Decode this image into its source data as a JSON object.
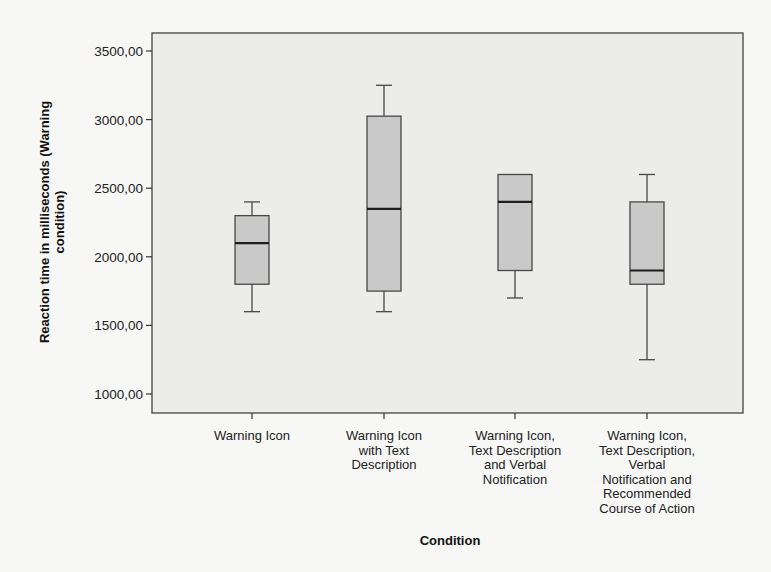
{
  "chart_data": {
    "type": "boxplot",
    "title": "",
    "xlabel": "Condition",
    "ylabel": "Reaction time in milliseconds (Warning condition)",
    "ylabel_lines": [
      "Reaction time in milliseconds (Warning",
      "condition)"
    ],
    "ylim": [
      850,
      3600
    ],
    "yticks": [
      1000,
      1500,
      2000,
      2500,
      3000,
      3500
    ],
    "ytick_labels": [
      "1000,00",
      "1500,00",
      "2000,00",
      "2500,00",
      "3000,00",
      "3500,00"
    ],
    "grid": false,
    "legend": null,
    "categories": [
      "Warning Icon",
      "Warning Icon with Text Description",
      "Warning Icon, Text Description and Verbal Notification",
      "Warning Icon, Text Description, Verbal Notification and Recommended Course of Action"
    ],
    "category_label_lines": [
      [
        "Warning Icon"
      ],
      [
        "Warning Icon",
        "with Text",
        "Description"
      ],
      [
        "Warning Icon,",
        "Text Description",
        "and Verbal",
        "Notification"
      ],
      [
        "Warning Icon,",
        "Text Description,",
        "Verbal",
        "Notification and",
        "Recommended",
        "Course of Action"
      ]
    ],
    "boxes": [
      {
        "category": "Warning Icon",
        "min": 1600,
        "q1": 1800,
        "median": 2100,
        "q3": 2300,
        "max": 2400
      },
      {
        "category": "Warning Icon with Text Description",
        "min": 1600,
        "q1": 1750,
        "median": 2350,
        "q3": 3025,
        "max": 3250
      },
      {
        "category": "Warning Icon, Text Description and Verbal Notification",
        "min": 1700,
        "q1": 1900,
        "median": 2400,
        "q3": 2600,
        "max": 2600
      },
      {
        "category": "Warning Icon, Text Description, Verbal Notification and Recommended Course of Action",
        "min": 1250,
        "q1": 1800,
        "median": 1900,
        "q3": 2400,
        "max": 2600
      }
    ]
  },
  "colors": {
    "plot_background": "#ececeb",
    "box_fill": "#c9c9c9",
    "box_stroke": "#484848",
    "median": "#1e1e1e",
    "axis": "#333333"
  }
}
